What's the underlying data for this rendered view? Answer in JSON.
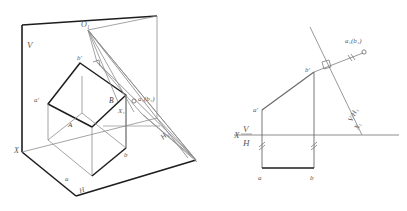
{
  "figure": {
    "colors": {
      "heavy_line": "#1d1d1d",
      "light_line": "#8d8d8d",
      "medium_line": "#6a6a6a",
      "label_text": "#5a5a5a",
      "background": "#ffffff"
    },
    "panels": [
      {
        "id": "pictorial",
        "name": "pictorial-axonometric-view",
        "labels": [
          {
            "key": "V",
            "text": "V",
            "sub": ""
          },
          {
            "key": "H",
            "text": "H",
            "sub": ""
          },
          {
            "key": "X",
            "text": "X",
            "sub": ""
          },
          {
            "key": "O1",
            "text": "O",
            "sub": "1"
          },
          {
            "key": "b_prime",
            "text": "b",
            "sub": ""
          },
          {
            "key": "a_prime",
            "text": "a",
            "sub": ""
          },
          {
            "key": "A",
            "text": "A",
            "sub": ""
          },
          {
            "key": "B",
            "text": "B",
            "sub": ""
          },
          {
            "key": "a_low",
            "text": "a",
            "sub": ""
          },
          {
            "key": "b_low",
            "text": "b",
            "sub": ""
          },
          {
            "key": "X1",
            "text": "X",
            "sub": "1"
          },
          {
            "key": "H1",
            "text": "H",
            "sub": "1"
          },
          {
            "key": "a1b1",
            "text": "a₁(b₁)",
            "sub": ""
          }
        ]
      },
      {
        "id": "orthographic",
        "name": "orthographic-two-view-projection",
        "labels": [
          {
            "key": "X",
            "text": "X",
            "sub": ""
          },
          {
            "key": "V",
            "text": "V",
            "sub": ""
          },
          {
            "key": "H",
            "text": "H",
            "sub": ""
          },
          {
            "key": "a_prime",
            "text": "a",
            "sub": ""
          },
          {
            "key": "b_prime",
            "text": "b",
            "sub": ""
          },
          {
            "key": "a_low",
            "text": "a",
            "sub": ""
          },
          {
            "key": "b_low",
            "text": "b",
            "sub": ""
          },
          {
            "key": "a1b1",
            "text": "a₁(b₁)",
            "sub": ""
          },
          {
            "key": "VH1",
            "text": "V/H₁",
            "sub": ""
          },
          {
            "key": "X1",
            "text": "X₁",
            "sub": ""
          }
        ]
      }
    ],
    "annotations": {
      "right_angle_marks": 2,
      "equal_tick_marks": 3,
      "point_markers": 2
    }
  },
  "labels": {
    "left": {
      "V": "V",
      "H": "H",
      "X": "X",
      "O1": "O₁",
      "b_prime": "b'",
      "a_prime": "a'",
      "A": "A",
      "B": "B",
      "a_low": "a",
      "b_low": "b",
      "X1": "X₁",
      "H1": "H₁",
      "a1b1": "a₁(b₁)"
    },
    "right": {
      "X": "X",
      "V": "V",
      "H": "H",
      "a_prime": "a'",
      "b_prime": "b'",
      "a_low": "a",
      "b_low": "b",
      "a1b1": "a₁(b₁)",
      "VH1": "V/H₁",
      "X1": "X₁"
    }
  }
}
